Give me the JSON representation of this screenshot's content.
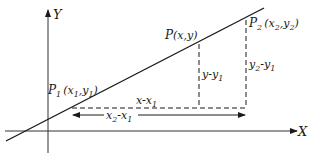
{
  "diagram": {
    "axes": {
      "x_label": "X",
      "y_label": "Y"
    },
    "points": {
      "p1": {
        "name": "P",
        "sub": "1",
        "coords_text": "(x",
        "coords_sub1": "1",
        "coords_mid": ",y",
        "coords_sub2": "1",
        "coords_close": ")"
      },
      "p": {
        "name": "P",
        "coords_text": "(x,y)"
      },
      "p2": {
        "name": "P",
        "sub": "2",
        "coords_text": "(x",
        "coords_sub1": "2",
        "coords_mid": ",y",
        "coords_sub2": "2",
        "coords_close": ")"
      }
    },
    "segments": {
      "x_minus_x1": {
        "main": "x-x",
        "sub": "1"
      },
      "x2_minus_x1": {
        "a": "x",
        "a_sub": "2",
        "mid": "-x",
        "b_sub": "1"
      },
      "y_minus_y1": {
        "main": "y-y",
        "sub": "1"
      },
      "y2_minus_y1": {
        "a": "y",
        "a_sub": "2",
        "mid": "-y",
        "b_sub": "1"
      }
    },
    "colors": {
      "ink": "#1a1a1a",
      "background": "#ffffff"
    }
  }
}
